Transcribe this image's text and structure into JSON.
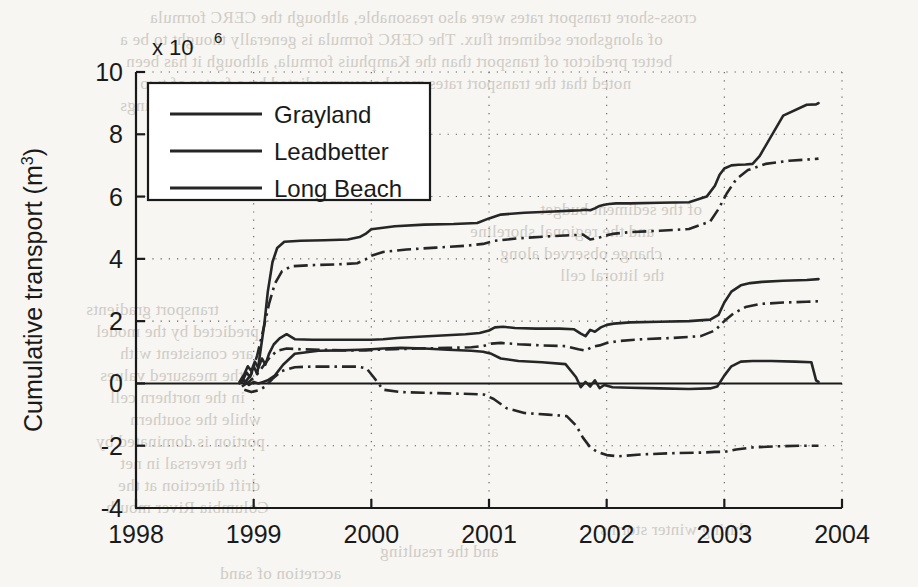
{
  "figure": {
    "background_color": "#f7f6f3",
    "ink_color": "#262626"
  },
  "chart_data": {
    "type": "line",
    "title": "",
    "xlabel": "",
    "ylabel": "Cumulative transport (m",
    "ylabel_sup": "3",
    "ylabel_tail": ")",
    "exponent_prefix": "x 10",
    "exponent_value": "6",
    "y_scale_factor": 1000000,
    "xlim": [
      1998,
      2004
    ],
    "ylim": [
      -4,
      10
    ],
    "xticks": [
      1998,
      1999,
      2000,
      2001,
      2002,
      2003,
      2004
    ],
    "xtick_labels": [
      "1998",
      "1999",
      "2000",
      "2001",
      "2002",
      "2003",
      "2004"
    ],
    "yticks": [
      -4,
      -2,
      0,
      2,
      4,
      6,
      8,
      10
    ],
    "ytick_labels": [
      "-4",
      "-2",
      "0",
      "2",
      "4",
      "6",
      "8",
      "10"
    ],
    "grid": true,
    "grid_style": "dotted",
    "legend_position": "upper-left",
    "legend_entries": [
      "Grayland",
      "Leadbetter",
      "Long Beach"
    ],
    "series": [
      {
        "name": "Grayland",
        "style": "solid",
        "x": [
          1998.9,
          1998.94,
          1998.97,
          1999.0,
          1999.03,
          1999.06,
          1999.09,
          1999.12,
          1999.16,
          1999.2,
          1999.26,
          1999.4,
          1999.6,
          1999.8,
          1999.9,
          1999.95,
          2000.0,
          2000.2,
          2000.45,
          2000.7,
          2000.9,
          2001.0,
          2001.1,
          2001.3,
          2001.55,
          2001.7,
          2001.78,
          2001.82,
          2001.86,
          2001.9,
          2001.94,
          2001.98,
          2002.02,
          2002.08,
          2002.2,
          2002.45,
          2002.7,
          2002.85,
          2002.92,
          2002.96,
          2003.0,
          2003.06,
          2003.12,
          2003.18,
          2003.24,
          2003.3,
          2003.5,
          2003.7,
          2003.78,
          2003.8
        ],
        "y": [
          0.05,
          0.35,
          0.2,
          0.55,
          0.3,
          1.1,
          1.9,
          2.95,
          3.9,
          4.35,
          4.55,
          4.58,
          4.6,
          4.62,
          4.7,
          4.8,
          4.95,
          5.05,
          5.1,
          5.12,
          5.15,
          5.3,
          5.42,
          5.48,
          5.52,
          5.55,
          5.56,
          5.58,
          5.56,
          5.62,
          5.7,
          5.74,
          5.76,
          5.78,
          5.78,
          5.8,
          5.82,
          6.0,
          6.35,
          6.7,
          6.9,
          7.0,
          7.02,
          7.03,
          7.05,
          7.3,
          8.6,
          8.95,
          8.96,
          9.0
        ]
      },
      {
        "name": "Grayland-model",
        "style": "dashdot",
        "x": [
          1998.92,
          1998.98,
          1999.03,
          1999.08,
          1999.13,
          1999.18,
          1999.24,
          1999.32,
          1999.5,
          1999.7,
          1999.88,
          1999.95,
          2000.0,
          2000.1,
          2000.3,
          2000.55,
          2000.8,
          2000.95,
          2001.05,
          2001.25,
          2001.5,
          2001.7,
          2001.8,
          2001.86,
          2001.92,
          2001.98,
          2002.05,
          2002.2,
          2002.45,
          2002.7,
          2002.88,
          2002.95,
          2003.02,
          2003.1,
          2003.2,
          2003.35,
          2003.55,
          2003.75,
          2003.8
        ],
        "y": [
          0.0,
          0.3,
          0.9,
          1.7,
          2.55,
          3.2,
          3.6,
          3.76,
          3.8,
          3.82,
          3.86,
          3.98,
          4.1,
          4.22,
          4.3,
          4.36,
          4.42,
          4.48,
          4.58,
          4.66,
          4.72,
          4.76,
          4.78,
          4.62,
          4.66,
          4.74,
          4.8,
          4.86,
          4.9,
          4.96,
          5.2,
          5.6,
          6.1,
          6.55,
          6.85,
          7.05,
          7.15,
          7.2,
          7.22
        ]
      },
      {
        "name": "Leadbetter",
        "style": "solid",
        "x": [
          1998.88,
          1998.92,
          1998.95,
          1998.98,
          1999.01,
          1999.04,
          1999.07,
          1999.1,
          1999.13,
          1999.17,
          1999.22,
          1999.28,
          1999.35,
          1999.5,
          1999.7,
          1999.9,
          2000.0,
          2000.1,
          2000.22,
          2000.4,
          2000.6,
          2000.8,
          2000.92,
          2001.0,
          2001.05,
          2001.12,
          2001.22,
          2001.4,
          2001.6,
          2001.72,
          2001.78,
          2001.82,
          2001.86,
          2001.9,
          2001.95,
          2002.0,
          2002.06,
          2002.2,
          2002.45,
          2002.7,
          2002.88,
          2002.95,
          2003.0,
          2003.06,
          2003.14,
          2003.22,
          2003.32,
          2003.5,
          2003.7,
          2003.8
        ],
        "y": [
          0.05,
          0.3,
          0.55,
          0.4,
          0.7,
          0.5,
          0.8,
          0.6,
          0.95,
          1.25,
          1.45,
          1.58,
          1.42,
          1.4,
          1.4,
          1.4,
          1.4,
          1.42,
          1.46,
          1.5,
          1.54,
          1.58,
          1.62,
          1.7,
          1.8,
          1.82,
          1.78,
          1.76,
          1.76,
          1.74,
          1.6,
          1.52,
          1.72,
          1.66,
          1.8,
          1.88,
          1.92,
          1.96,
          1.98,
          2.0,
          2.05,
          2.2,
          2.6,
          2.95,
          3.15,
          3.22,
          3.26,
          3.3,
          3.32,
          3.35
        ]
      },
      {
        "name": "Leadbetter-model",
        "style": "dashdot",
        "x": [
          1998.9,
          1998.96,
          1999.02,
          1999.08,
          1999.14,
          1999.2,
          1999.28,
          1999.4,
          1999.6,
          1999.8,
          1999.95,
          2000.05,
          2000.2,
          2000.4,
          2000.65,
          2000.85,
          2000.95,
          2001.02,
          2001.1,
          2001.25,
          2001.45,
          2001.65,
          2001.76,
          2001.82,
          2001.88,
          2001.94,
          2002.0,
          2002.1,
          2002.3,
          2002.55,
          2002.8,
          2002.92,
          2003.0,
          2003.08,
          2003.18,
          2003.3,
          2003.5,
          2003.7,
          2003.8
        ],
        "y": [
          -0.1,
          0.05,
          0.25,
          0.55,
          0.85,
          1.05,
          1.12,
          1.1,
          1.08,
          1.06,
          1.06,
          1.08,
          1.1,
          1.12,
          1.14,
          1.16,
          1.2,
          1.28,
          1.3,
          1.26,
          1.22,
          1.2,
          1.1,
          1.05,
          1.18,
          1.22,
          1.3,
          1.36,
          1.42,
          1.46,
          1.52,
          1.7,
          2.0,
          2.25,
          2.45,
          2.55,
          2.6,
          2.62,
          2.64
        ]
      },
      {
        "name": "Long Beach",
        "style": "solid",
        "x": [
          1998.88,
          1998.92,
          1998.96,
          1999.0,
          1999.04,
          1999.08,
          1999.12,
          1999.18,
          1999.25,
          1999.35,
          1999.55,
          1999.75,
          1999.9,
          2000.0,
          2000.1,
          2000.25,
          2000.45,
          2000.65,
          2000.85,
          2000.95,
          2001.02,
          2001.1,
          2001.25,
          2001.45,
          2001.65,
          2001.74,
          2001.78,
          2001.82,
          2001.86,
          2001.9,
          2001.94,
          2001.98,
          2002.05,
          2002.2,
          2002.45,
          2002.7,
          2002.88,
          2002.94,
          2003.0,
          2003.06,
          2003.14,
          2003.24,
          2003.4,
          2003.6,
          2003.74,
          2003.78,
          2003.8
        ],
        "y": [
          0.0,
          0.1,
          -0.05,
          0.05,
          0.0,
          0.05,
          0.1,
          0.25,
          0.6,
          0.95,
          1.05,
          1.06,
          1.08,
          1.1,
          1.12,
          1.14,
          1.12,
          1.08,
          1.05,
          1.02,
          0.95,
          0.8,
          0.72,
          0.68,
          0.62,
          0.2,
          -0.12,
          0.05,
          -0.1,
          0.1,
          -0.15,
          -0.05,
          -0.12,
          -0.14,
          -0.16,
          -0.18,
          -0.16,
          -0.1,
          0.25,
          0.55,
          0.7,
          0.72,
          0.72,
          0.7,
          0.68,
          0.1,
          0.05
        ]
      },
      {
        "name": "Long Beach-model",
        "style": "dashdot",
        "x": [
          1998.92,
          1998.98,
          1999.04,
          1999.1,
          1999.16,
          1999.24,
          1999.35,
          1999.5,
          1999.7,
          1999.88,
          1999.96,
          2000.02,
          2000.1,
          2000.25,
          2000.45,
          2000.65,
          2000.85,
          2000.96,
          2001.04,
          2001.15,
          2001.3,
          2001.5,
          2001.66,
          2001.74,
          2001.8,
          2001.86,
          2001.92,
          2002.0,
          2002.1,
          2002.3,
          2002.55,
          2002.8,
          2002.92,
          2003.0,
          2003.1,
          2003.25,
          2003.45,
          2003.65,
          2003.8
        ],
        "y": [
          -0.2,
          -0.28,
          -0.22,
          -0.1,
          0.15,
          0.4,
          0.52,
          0.54,
          0.54,
          0.54,
          0.48,
          0.2,
          -0.2,
          -0.28,
          -0.3,
          -0.32,
          -0.34,
          -0.36,
          -0.5,
          -0.8,
          -0.95,
          -1.0,
          -1.05,
          -1.35,
          -1.75,
          -2.05,
          -2.2,
          -2.3,
          -2.34,
          -2.28,
          -2.24,
          -2.22,
          -2.2,
          -2.2,
          -2.12,
          -2.05,
          -2.02,
          -2.0,
          -2.0
        ]
      }
    ]
  },
  "bleed_text": {
    "lines": [
      {
        "text": "cross-shore transport rates were also reasonable, although the CERC formula",
        "x": 150,
        "y": 8
      },
      {
        "text": "of alongshore sediment flux. The CERC formula is generally thought to be a",
        "x": 120,
        "y": 30
      },
      {
        "text": "better predictor of transport than the Kamphuis formula, although it has been",
        "x": 126,
        "y": 52
      },
      {
        "text": "noted that the transport rates may be overpredicted by a factor of two",
        "x": 140,
        "y": 74
      },
      {
        "text": "in some settings",
        "x": 120,
        "y": 96
      },
      {
        "text": "of the sediment budget",
        "x": 540,
        "y": 200
      },
      {
        "text": "and the regional shoreline",
        "x": 470,
        "y": 222
      },
      {
        "text": "change observed along",
        "x": 500,
        "y": 244
      },
      {
        "text": "the littoral cell",
        "x": 560,
        "y": 266
      },
      {
        "text": "transport gradients",
        "x": 86,
        "y": 300
      },
      {
        "text": "predicted by the model",
        "x": 96,
        "y": 322
      },
      {
        "text": "are consistent with",
        "x": 120,
        "y": 344
      },
      {
        "text": "the measured values",
        "x": 100,
        "y": 366
      },
      {
        "text": "in the northern cell",
        "x": 110,
        "y": 388
      },
      {
        "text": "while the southern",
        "x": 130,
        "y": 410
      },
      {
        "text": "portion is dominated by",
        "x": 96,
        "y": 432
      },
      {
        "text": "the reversal in net",
        "x": 120,
        "y": 454
      },
      {
        "text": "drift direction at the",
        "x": 118,
        "y": 476
      },
      {
        "text": "Columbia River mouth",
        "x": 106,
        "y": 498
      },
      {
        "text": "during winter storms",
        "x": 600,
        "y": 520
      },
      {
        "text": "and the resulting",
        "x": 380,
        "y": 542
      },
      {
        "text": "accretion of sand",
        "x": 220,
        "y": 564
      }
    ]
  }
}
